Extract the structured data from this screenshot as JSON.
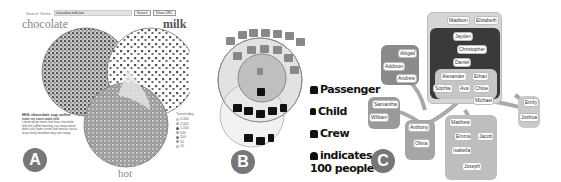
{
  "panels": {
    "a": {
      "label": "A",
      "search": {
        "label": "Search Terms:",
        "value": "chocolate,milk,hot",
        "search_button": "Search",
        "show_button": "Show URL"
      },
      "sets": {
        "left": "chocolate",
        "right": "milk",
        "bottom": "hot"
      },
      "article": {
        "title": "Milk chocolate cup coffee",
        "subtitle": "made my sweet wake milk",
        "body": "Lorem ipsum tweet text lines chocolate milk hot coffee morning cup sweet warm drink cafe foam cream latte mocha cocoa tasty lovely breakfast day start enjoy"
      },
      "legend": {
        "title": "Tweets/day",
        "items": [
          "4,000",
          "2,000",
          "1,000",
          "500",
          "200",
          "50",
          "10"
        ]
      }
    },
    "b": {
      "label": "B",
      "legend": [
        {
          "icon": "passenger-icon",
          "label": "Passenger"
        },
        {
          "icon": "child-icon",
          "label": "Child"
        },
        {
          "icon": "crew-icon",
          "label": "Crew"
        },
        {
          "icon": "person-icon",
          "label": "indicates",
          "sub": "100 people"
        }
      ]
    },
    "c": {
      "label": "C",
      "names": {
        "madison": "Madison",
        "elizabeth": "Elizabeth",
        "jayden": "Jayden",
        "christopher": "Christopher",
        "daniel": "Daniel",
        "abigail": "Abigail",
        "addison": "Addison",
        "andrew": "Andrew",
        "alexander": "Alexander",
        "ethan": "Ethan",
        "sophia": "Sophia",
        "ava": "Ava",
        "chloe": "Chloe",
        "michael": "Michael",
        "samantha": "Samantha",
        "william": "William",
        "emily": "Emily",
        "joshua": "Joshua",
        "anthony": "Anthony",
        "olivia": "Olivia",
        "matthew": "Matthew",
        "emma": "Emma",
        "jacob": "Jacob",
        "isabella": "Isabella",
        "joseph": "Joseph"
      }
    }
  }
}
